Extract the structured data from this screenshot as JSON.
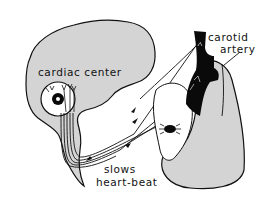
{
  "diagram": {
    "labels": {
      "cardiac_center": "cardiac center",
      "carotid_line1": "carotid",
      "carotid_line2": "artery",
      "slows_line1": "slows",
      "slows_line2": "heart-beat"
    },
    "colors": {
      "brain_fill": "#d4d4d4",
      "heart_fill": "#d4d4d4",
      "artery_fill": "#0a0a0a",
      "outline": "#111111",
      "background": "#ffffff"
    },
    "components": [
      "brain",
      "brainstem",
      "cardiac-center-circle",
      "carotid-artery",
      "heart",
      "sinoatrial-node",
      "nerve-fibers",
      "arrows"
    ]
  }
}
